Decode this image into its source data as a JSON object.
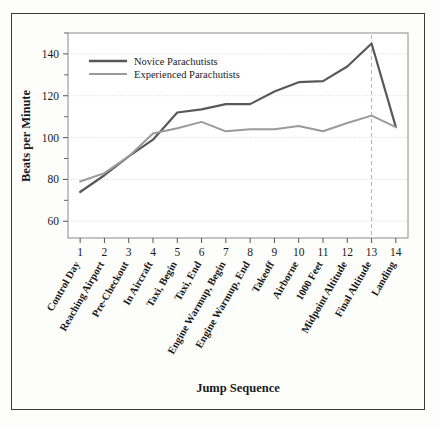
{
  "chart_data": {
    "type": "line",
    "title": "",
    "xlabel": "Jump Sequence",
    "ylabel": "Beats per Minute",
    "xlim": [
      0.5,
      14.5
    ],
    "ylim": [
      52,
      150
    ],
    "grid": true,
    "legend_position": "top-left-inside",
    "x": [
      1,
      2,
      3,
      4,
      5,
      6,
      7,
      8,
      9,
      10,
      11,
      12,
      13,
      14
    ],
    "xtick_labels": [
      "1",
      "2",
      "3",
      "4",
      "5",
      "6",
      "7",
      "8",
      "9",
      "10",
      "11",
      "12",
      "13",
      "14"
    ],
    "ytick_labels": [
      "60",
      "80",
      "100",
      "120",
      "140"
    ],
    "ytick_values": [
      60,
      80,
      100,
      120,
      140
    ],
    "yminor_values": [
      70,
      90,
      110,
      130,
      150
    ],
    "categories": [
      "Control Day",
      "Reaching Airport",
      "Pre-Checkout",
      "In Aircraft",
      "Taxi, Begin",
      "Taxi, End",
      "Engine Warmup, Begin",
      "Engine Warmup, End",
      "Takeoff",
      "Airborne",
      "1000 Feet",
      "Midpoint Altitude",
      "Final Altitude",
      "Landing"
    ],
    "series": [
      {
        "name": "Novice Parachutists",
        "color": "#585858",
        "values": [
          74,
          82,
          91,
          99,
          112,
          113.5,
          116,
          116,
          122,
          126.5,
          127,
          134,
          145,
          105
        ]
      },
      {
        "name": "Experienced Parachutists",
        "color": "#9a9a9a",
        "values": [
          79,
          83,
          91,
          102,
          104.5,
          107.5,
          103,
          104,
          104,
          105.5,
          103,
          107,
          110.5,
          105
        ]
      }
    ],
    "annotations": [
      {
        "type": "vertical-dashed-line",
        "at_x": 13,
        "label": "Final Altitude",
        "color": "#b0b0b0"
      }
    ]
  },
  "legend": {
    "entries": [
      {
        "label": "Novice Parachutists",
        "color": "#585858"
      },
      {
        "label": "Experienced Parachutists",
        "color": "#9a9a9a"
      }
    ]
  },
  "axes": {
    "y_title": "Beats per Minute",
    "x_title": "Jump Sequence"
  },
  "colors": {
    "novice": "#585858",
    "experienced": "#9a9a9a",
    "frame": "#3a3a3a",
    "plot_border": "#8a8a8a",
    "gridline": "#cfcfcf",
    "dashed_marker": "#b0b0b0",
    "background": "#fdfdfc"
  }
}
